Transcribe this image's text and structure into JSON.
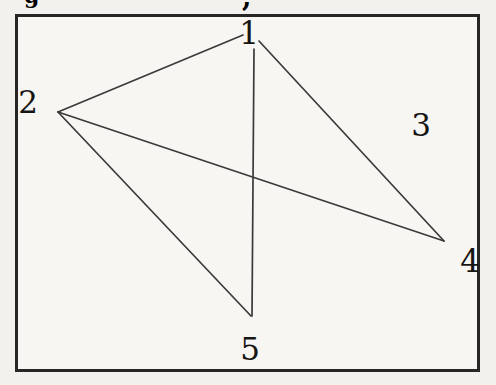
{
  "figure": {
    "kind": "undirected-graph",
    "background_color": "#f2f1ee",
    "box_fill": "#f7f6f3",
    "box_border_color": "#272624",
    "edge_color": "#3a3a38",
    "edge_width": 1.7,
    "label_color": "#161513",
    "vertices": [
      {
        "id": "1",
        "label": "1",
        "x": 249,
        "y": 33
      },
      {
        "id": "2",
        "label": "2",
        "x": 28,
        "y": 102
      },
      {
        "id": "3",
        "label": "3",
        "x": 421,
        "y": 125
      },
      {
        "id": "4",
        "label": "4",
        "x": 470,
        "y": 261
      },
      {
        "id": "5",
        "label": "5",
        "x": 250,
        "y": 349
      }
    ],
    "edges": [
      {
        "from": "1",
        "to": "2",
        "x1": 243,
        "y1": 35,
        "x2": 58,
        "y2": 112
      },
      {
        "from": "1",
        "to": "4",
        "x1": 259,
        "y1": 41,
        "x2": 444,
        "y2": 241
      },
      {
        "from": "1",
        "to": "5",
        "x1": 254,
        "y1": 49,
        "x2": 252,
        "y2": 316
      },
      {
        "from": "2",
        "to": "4",
        "x1": 58,
        "y1": 112,
        "x2": 444,
        "y2": 241
      },
      {
        "from": "2",
        "to": "5",
        "x1": 58,
        "y1": 112,
        "x2": 251,
        "y2": 316
      }
    ],
    "isolated_vertices": [
      "3"
    ]
  },
  "artifacts": {
    "top_left_glyph": "g",
    "top_center_glyph": ","
  }
}
